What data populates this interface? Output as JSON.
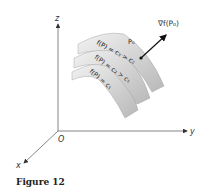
{
  "figure": {
    "caption": "Figure 12",
    "axes": {
      "z_label": "z",
      "y_label": "y",
      "x_label": "x",
      "origin_label": "O"
    },
    "surfaces": [
      {
        "label": "f(P) = c₃ > c₂",
        "level": "top"
      },
      {
        "label": "f(P) = c₂ > c₁",
        "level": "middle"
      },
      {
        "label": "f(P) = c₁",
        "level": "bottom"
      }
    ],
    "point_label": "P₀",
    "gradient_label": "∇f(P₀)"
  }
}
